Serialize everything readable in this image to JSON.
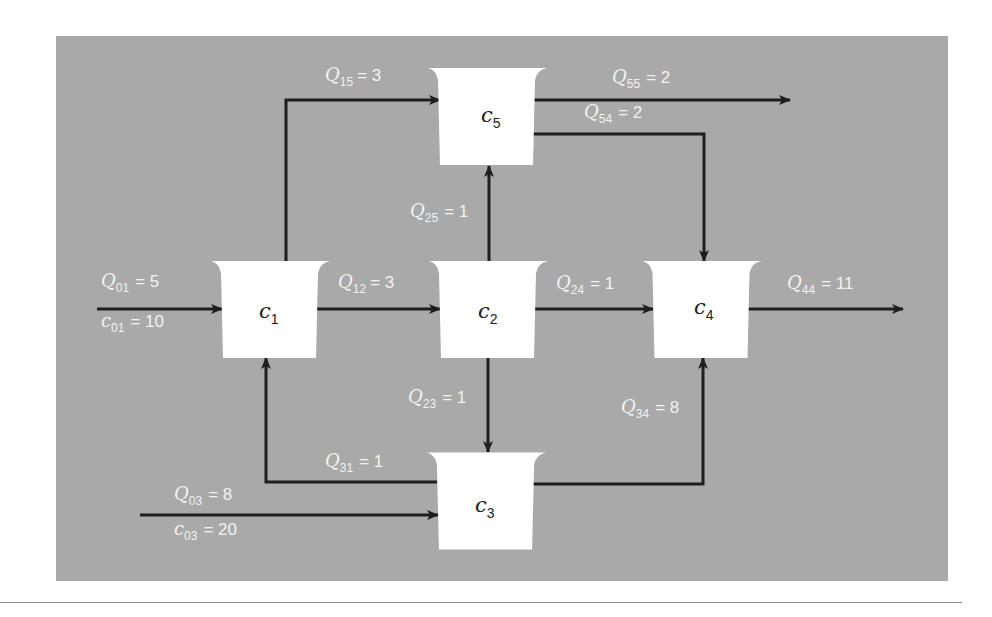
{
  "diagram": {
    "type": "reactor-network",
    "reactors": [
      {
        "id": "c1",
        "symbol": "c",
        "sub": "1"
      },
      {
        "id": "c2",
        "symbol": "c",
        "sub": "2"
      },
      {
        "id": "c3",
        "symbol": "c",
        "sub": "3"
      },
      {
        "id": "c4",
        "symbol": "c",
        "sub": "4"
      },
      {
        "id": "c5",
        "symbol": "c",
        "sub": "5"
      }
    ],
    "flows": {
      "Q01": {
        "symbol": "Q",
        "sub": "01",
        "value": "= 5"
      },
      "c01": {
        "symbol": "c",
        "sub": "01",
        "value": "= 10"
      },
      "Q12": {
        "symbol": "Q",
        "sub": "12",
        "value": "= 3"
      },
      "Q15": {
        "symbol": "Q",
        "sub": "15",
        "value": "= 3"
      },
      "Q55": {
        "symbol": "Q",
        "sub": "55",
        "value": "= 2"
      },
      "Q54": {
        "symbol": "Q",
        "sub": "54",
        "value": "= 2"
      },
      "Q25": {
        "symbol": "Q",
        "sub": "25",
        "value": "= 1"
      },
      "Q24": {
        "symbol": "Q",
        "sub": "24",
        "value": "= 1"
      },
      "Q44": {
        "symbol": "Q",
        "sub": "44",
        "value": "= 11"
      },
      "Q23": {
        "symbol": "Q",
        "sub": "23",
        "value": "= 1"
      },
      "Q34": {
        "symbol": "Q",
        "sub": "34",
        "value": "= 8"
      },
      "Q31": {
        "symbol": "Q",
        "sub": "31",
        "value": "= 1"
      },
      "Q03": {
        "symbol": "Q",
        "sub": "03",
        "value": "= 8"
      },
      "c03": {
        "symbol": "c",
        "sub": "03",
        "value": "= 20"
      }
    },
    "colors": {
      "panel": "#a9a9a9",
      "reactor_fill": "#ffffff",
      "arrow": "#1e1e1e",
      "label": "#f2f2f2"
    }
  }
}
